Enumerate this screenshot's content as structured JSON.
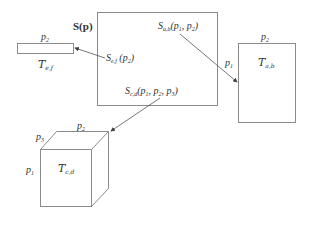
{
  "diagram": {
    "main_box": {
      "title": "S(p)"
    },
    "labels": {
      "s_ab": {
        "base": "S",
        "sub": "a,b",
        "args": "(p",
        "args_sub1": "1",
        "args_mid": ", p",
        "args_sub2": "2",
        "args_end": ")"
      },
      "s_ef": {
        "base": "S",
        "sub": "e,f",
        "args": " (p",
        "args_sub1": "2",
        "args_end": ")"
      },
      "s_cd": {
        "base": "S",
        "sub": "c,d",
        "args": "(p",
        "args_sub1": "1",
        "args_mid": ", p",
        "args_sub2": "2",
        "args_mid2": ", p",
        "args_sub3": "3",
        "args_end": ")"
      }
    },
    "tensor_ef": {
      "name": "T",
      "sub": "e,f",
      "dim_top": "p",
      "dim_top_sub": "2"
    },
    "tensor_ab": {
      "name": "T",
      "sub": "a,b",
      "dim_top": "p",
      "dim_top_sub": "2",
      "dim_left": "p",
      "dim_left_sub": "1"
    },
    "tensor_cd": {
      "name": "T",
      "sub": "c,d",
      "dim_top": "p",
      "dim_top_sub": "2",
      "dim_depth": "p",
      "dim_depth_sub": "3",
      "dim_left": "p",
      "dim_left_sub": "1"
    },
    "colors": {
      "stroke": "#8a8a8a",
      "text": "#333333",
      "arrow": "#555555"
    }
  }
}
